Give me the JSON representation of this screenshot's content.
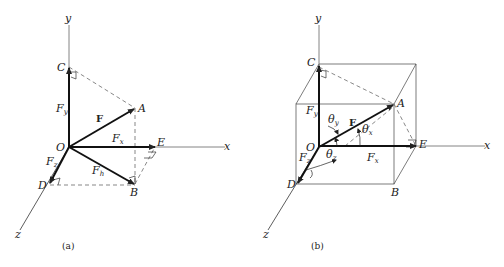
{
  "figure": {
    "panels": [
      {
        "id": "a",
        "caption": "(a)",
        "axes": {
          "x": "x",
          "y": "y",
          "z": "z"
        },
        "points": {
          "origin": "O",
          "A": "A",
          "B": "B",
          "C": "C",
          "D": "D",
          "E": "E"
        },
        "vectors": {
          "F": "F",
          "Fx": {
            "base": "F",
            "sub": "x"
          },
          "Fy": {
            "base": "F",
            "sub": "y"
          },
          "Fz": {
            "base": "F",
            "sub": "z"
          },
          "Fh": {
            "base": "F",
            "sub": "h"
          }
        }
      },
      {
        "id": "b",
        "caption": "(b)",
        "axes": {
          "x": "x",
          "y": "y",
          "z": "z"
        },
        "points": {
          "origin": "O",
          "A": "A",
          "B": "B",
          "C": "C",
          "D": "D",
          "E": "E"
        },
        "vectors": {
          "F": "F",
          "Fx": {
            "base": "F",
            "sub": "x"
          },
          "Fy": {
            "base": "F",
            "sub": "y"
          },
          "Fz": {
            "base": "F",
            "sub": "z"
          }
        },
        "angles": {
          "theta_x": {
            "base": "θ",
            "sub": "x"
          },
          "theta_y": {
            "base": "θ",
            "sub": "y"
          },
          "theta_z": {
            "base": "θ",
            "sub": "z"
          }
        }
      }
    ],
    "colors": {
      "ink": "#222222",
      "axis": "#555555",
      "background": "#ffffff"
    }
  }
}
